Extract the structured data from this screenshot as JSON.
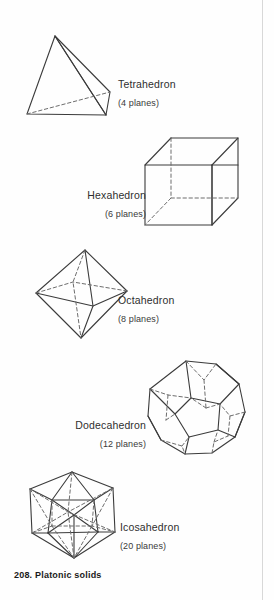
{
  "page": {
    "caption": "208. Platonic solids",
    "background_color": "#fefefe",
    "ink_color": "#3b3b3b",
    "hidden_edge_color": "#6d6d6d",
    "rule_color": "#d8d8d8"
  },
  "solids": [
    {
      "id": "tetrahedron",
      "name": "Tetrahedron",
      "planes_label": "(4 planes)",
      "faces": 4
    },
    {
      "id": "hexahedron",
      "name": "Hexahedron",
      "planes_label": "(6 planes)",
      "faces": 6
    },
    {
      "id": "octahedron",
      "name": "Octahedron",
      "planes_label": "(8 planes)",
      "faces": 8
    },
    {
      "id": "dodecahedron",
      "name": "Dodecahedron",
      "planes_label": "(12 planes)",
      "faces": 12
    },
    {
      "id": "icosahedron",
      "name": "Icosahedron",
      "planes_label": "(20 planes)",
      "faces": 20
    }
  ]
}
